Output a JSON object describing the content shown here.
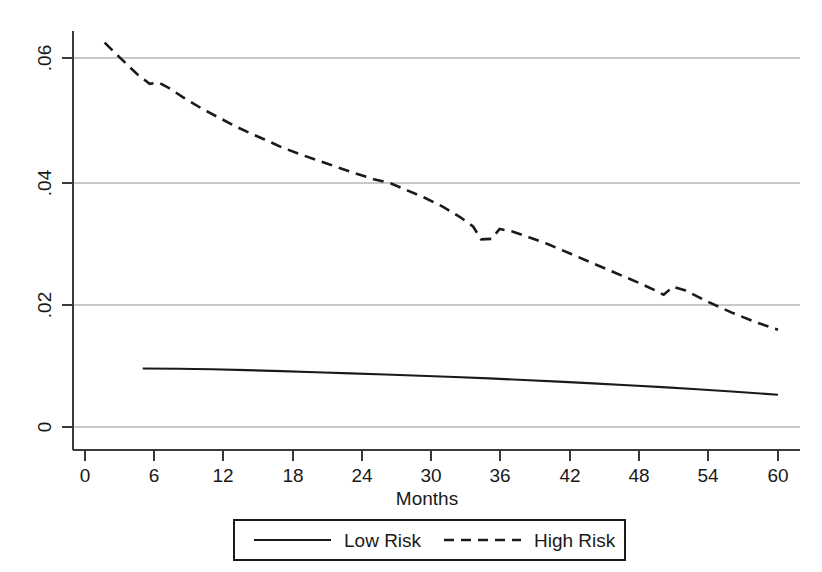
{
  "chart_data": {
    "type": "line",
    "title": "",
    "xlabel": "Months",
    "ylabel": "",
    "xlim": [
      0,
      61.5
    ],
    "ylim": [
      -0.0025,
      0.0685
    ],
    "grid": true,
    "grid_axis": "y",
    "legend_position": "bottom-center",
    "xticks": [
      0,
      6,
      12,
      18,
      24,
      30,
      36,
      42,
      48,
      54,
      60
    ],
    "xtick_labels": [
      "0",
      "6",
      "12",
      "18",
      "24",
      "30",
      "36",
      "42",
      "48",
      "54",
      "60"
    ],
    "yticks": [
      0,
      0.02,
      0.04,
      0.06
    ],
    "ytick_labels": [
      "0",
      ".02",
      ".04",
      ".06"
    ],
    "series": [
      {
        "name": "Low Risk",
        "style": "solid",
        "color": "#1a1a1a",
        "x": [
          5.0,
          8.0,
          11.0,
          14.0,
          17.0,
          20.0,
          23.0,
          26.0,
          29.0,
          32.0,
          35.0,
          38.0,
          41.0,
          44.0,
          47.0,
          50.0,
          53.0,
          56.0,
          60.0
        ],
        "y": [
          0.00952,
          0.00948,
          0.0094,
          0.00925,
          0.00908,
          0.0089,
          0.00872,
          0.00853,
          0.00833,
          0.00812,
          0.0079,
          0.00765,
          0.00738,
          0.0071,
          0.0068,
          0.00648,
          0.00614,
          0.00578,
          0.00525
        ]
      },
      {
        "name": "High Risk",
        "style": "dashed",
        "color": "#1a1a1a",
        "x": [
          1.7,
          3.0,
          4.5,
          5.6,
          6.4,
          7.2,
          8.5,
          10.0,
          11.5,
          13.0,
          14.5,
          15.5,
          17.0,
          19.0,
          21.0,
          23.0,
          25.0,
          26.5,
          28.0,
          29.5,
          31.0,
          32.5,
          33.6,
          34.3,
          35.2,
          35.9,
          37.0,
          38.5,
          40.0,
          42.0,
          44.0,
          46.0,
          48.0,
          49.4,
          50.1,
          50.9,
          52.0,
          54.0,
          56.0,
          58.0,
          60.0
        ],
        "y": [
          0.0625,
          0.0601,
          0.0574,
          0.0558,
          0.056,
          0.0552,
          0.0536,
          0.0519,
          0.0504,
          0.0489,
          0.0476,
          0.0468,
          0.0455,
          0.0441,
          0.0428,
          0.0415,
          0.0403,
          0.0396,
          0.0384,
          0.0372,
          0.0358,
          0.0341,
          0.0326,
          0.0305,
          0.0306,
          0.0322,
          0.0318,
          0.0308,
          0.0298,
          0.0282,
          0.0266,
          0.025,
          0.0234,
          0.0222,
          0.0215,
          0.0228,
          0.0222,
          0.0203,
          0.0186,
          0.0171,
          0.0158
        ]
      }
    ]
  },
  "axes": {
    "x_title": "Months",
    "xtick_labels": [
      "0",
      "6",
      "12",
      "18",
      "24",
      "30",
      "36",
      "42",
      "48",
      "54",
      "60"
    ],
    "ytick_labels": [
      ".06",
      ".04",
      ".02",
      "0"
    ]
  },
  "legend": {
    "entries": [
      {
        "label": "Low Risk",
        "style": "solid"
      },
      {
        "label": "High Risk",
        "style": "dashed"
      }
    ]
  },
  "colors": {
    "line": "#1a1a1a",
    "grid": "#c8c8c8",
    "axis": "#3a3a3a",
    "background": "#ffffff"
  }
}
